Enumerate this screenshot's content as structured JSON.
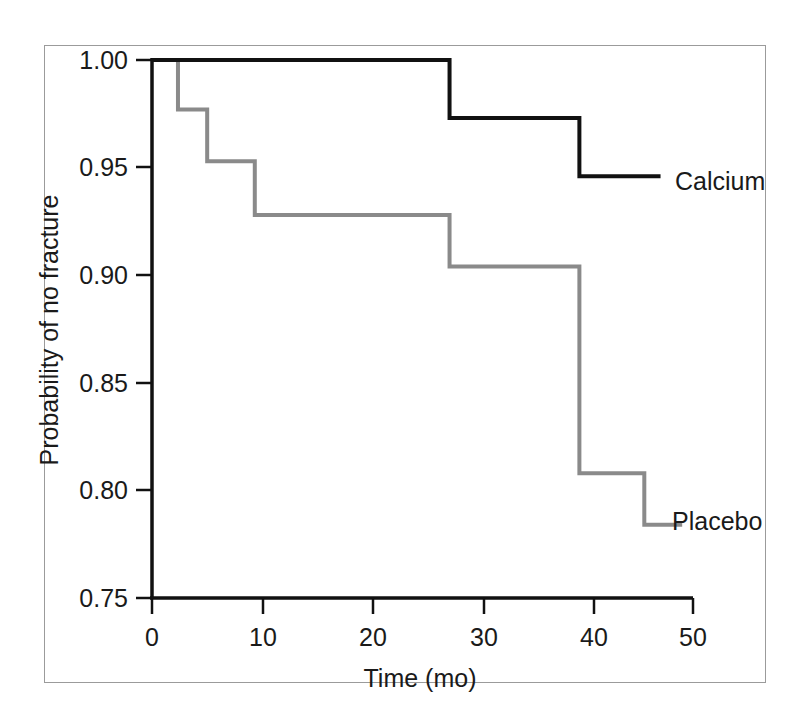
{
  "figure": {
    "frame_color": "#9b9b9b",
    "background": "#ffffff"
  },
  "chart_data": {
    "type": "line",
    "title": "",
    "subtitle": "",
    "xlabel": "Time (mo)",
    "ylabel": "Probability of no fracture",
    "xlim": [
      0,
      50
    ],
    "ylim": [
      0.75,
      1.0
    ],
    "xticks": [
      0,
      10,
      20,
      30,
      40,
      50
    ],
    "xticklabels": [
      "0",
      "10",
      "20",
      "30",
      "40",
      "50"
    ],
    "yticks": [
      0.75,
      0.8,
      0.85,
      0.9,
      0.95,
      1.0
    ],
    "yticklabels": [
      "0.75",
      "0.80",
      "0.85",
      "0.90",
      "0.95",
      "1.00"
    ],
    "grid": false,
    "legend_position": "inline-right-of-curve-end",
    "step_style": "post",
    "series": [
      {
        "name": "Calcium",
        "color": "#111111",
        "linewidth": 4,
        "label_x": 47.0,
        "label_y": 0.946,
        "x": [
          0.0,
          27.5,
          27.5,
          39.5,
          39.5,
          47.0
        ],
        "y": [
          1.0,
          1.0,
          0.973,
          0.973,
          0.946,
          0.946
        ],
        "steps": [
          {
            "time": 0.0,
            "prob": 1.0
          },
          {
            "time": 27.5,
            "prob": 0.973
          },
          {
            "time": 39.5,
            "prob": 0.946
          },
          {
            "time": 47.0,
            "prob": 0.946
          }
        ]
      },
      {
        "name": "Placebo",
        "color": "#8a8a8a",
        "linewidth": 4,
        "label_x": 47.0,
        "label_y": 0.784,
        "x": [
          0.3,
          2.4,
          2.4,
          5.1,
          5.1,
          9.5,
          9.5,
          27.5,
          27.5,
          39.5,
          39.5,
          45.5,
          45.5,
          49.0
        ],
        "y": [
          1.0,
          1.0,
          0.977,
          0.977,
          0.953,
          0.953,
          0.928,
          0.928,
          0.904,
          0.904,
          0.808,
          0.808,
          0.784,
          0.784
        ],
        "steps": [
          {
            "time": 0.3,
            "prob": 1.0
          },
          {
            "time": 2.4,
            "prob": 0.977
          },
          {
            "time": 5.1,
            "prob": 0.953
          },
          {
            "time": 9.5,
            "prob": 0.928
          },
          {
            "time": 27.5,
            "prob": 0.904
          },
          {
            "time": 39.5,
            "prob": 0.808
          },
          {
            "time": 45.5,
            "prob": 0.784
          },
          {
            "time": 49.0,
            "prob": 0.784
          }
        ]
      }
    ],
    "annotations": [
      {
        "text": "Calcium",
        "series": "Calcium"
      },
      {
        "text": "Placebo",
        "series": "Placebo"
      }
    ]
  },
  "labels": {
    "x_axis_title": "Time (mo)",
    "y_axis_title": "Probability of no fracture",
    "calcium": "Calcium",
    "placebo": "Placebo",
    "x_tick_0": "0",
    "x_tick_1": "10",
    "x_tick_2": "20",
    "x_tick_3": "30",
    "x_tick_4": "40",
    "x_tick_5": "50",
    "y_tick_0": "1.00",
    "y_tick_1": "0.95",
    "y_tick_2": "0.90",
    "y_tick_3": "0.85",
    "y_tick_4": "0.80",
    "y_tick_5": "0.75"
  }
}
